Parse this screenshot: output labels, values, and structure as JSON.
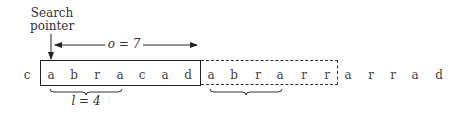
{
  "diagram": {
    "pointer_label_line1": "Search",
    "pointer_label_line2": "pointer",
    "offset_label": "o = 7",
    "length_label": "l = 4",
    "preceding_char": "c",
    "search_buffer": [
      "a",
      "b",
      "r",
      "a",
      "c",
      "a",
      "d"
    ],
    "lookahead_buffer": [
      "a",
      "b",
      "r",
      "a",
      "r",
      "r"
    ],
    "remaining": [
      "a",
      "r",
      "r",
      "a",
      "d"
    ],
    "colors": {
      "stroke": "#222222",
      "text": "#444444",
      "background": "#ffffff"
    }
  }
}
